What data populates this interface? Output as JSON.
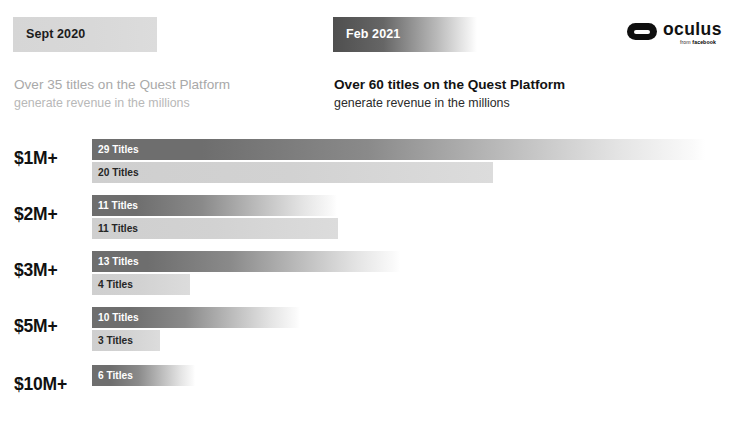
{
  "header": {
    "periods": [
      {
        "chip_label": "Sept 2020",
        "headline": "Over 35 titles on the Quest Platform",
        "subhead": "generate revenue in the millions",
        "chip_color": "#d8d8d8",
        "chip_text_color": "#1c1c1c",
        "text_color": "#a9a9a9"
      },
      {
        "chip_label": "Feb 2021",
        "headline": "Over 60 titles on the Quest Platform",
        "subhead": "generate revenue in the millions",
        "chip_color": "#4f4f4f",
        "chip_text_color": "#ffffff",
        "text_color": "#131313"
      }
    ],
    "logo": {
      "mark": "oculus-pill-icon",
      "wordmark": "oculus",
      "byline_prefix": "from ",
      "byline_brand": "facebook"
    }
  },
  "chart_data": {
    "type": "bar",
    "orientation": "horizontal",
    "xlabel": "",
    "ylabel": "Revenue threshold",
    "categories": [
      "$1M+",
      "$2M+",
      "$3M+",
      "$5M+",
      "$10M+"
    ],
    "legend_position": "top",
    "grid": false,
    "value_suffix": " Titles",
    "series": [
      {
        "name": "Feb 2021",
        "color": "#6e6e6e",
        "values": [
          29,
          11,
          13,
          10,
          6
        ],
        "labels": [
          "29 Titles",
          "11 Titles",
          "13 Titles",
          "10 Titles",
          "6 Titles"
        ],
        "bar_widths_px": [
          613,
          245,
          308,
          208,
          103
        ]
      },
      {
        "name": "Sept 2020",
        "color": "#cfcfcf",
        "values": [
          20,
          11,
          4,
          3,
          null
        ],
        "labels": [
          "20 Titles",
          "11 Titles",
          "4 Titles",
          "3 Titles",
          ""
        ],
        "bar_widths_px": [
          401,
          246,
          98,
          68,
          0
        ]
      }
    ],
    "totals": {
      "Sept 2020": 38,
      "Feb 2021": 69
    }
  }
}
